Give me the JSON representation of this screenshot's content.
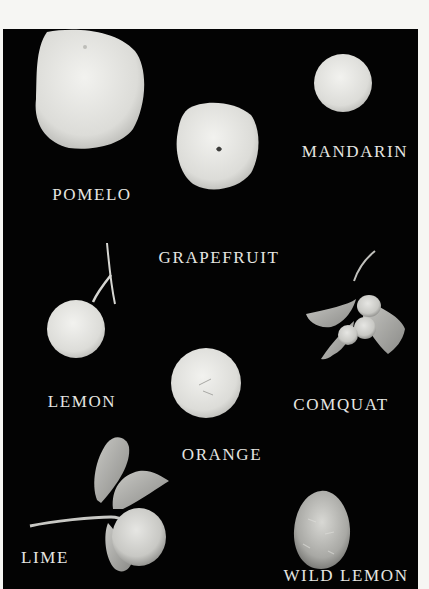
{
  "plate": {
    "background_color": "#030303",
    "page_color": "#f6f6f3",
    "label_color": "#e6e6e2"
  },
  "fruits": [
    {
      "id": "pomelo",
      "label": "POMELO"
    },
    {
      "id": "mandarin",
      "label": "MANDARIN"
    },
    {
      "id": "grapefruit",
      "label": "GRAPEFRUIT"
    },
    {
      "id": "lemon",
      "label": "LEMON"
    },
    {
      "id": "comquat",
      "label": "COMQUAT"
    },
    {
      "id": "orange",
      "label": "ORANGE"
    },
    {
      "id": "lime",
      "label": "LIME"
    },
    {
      "id": "wild-lemon",
      "label": "WILD LEMON"
    }
  ]
}
